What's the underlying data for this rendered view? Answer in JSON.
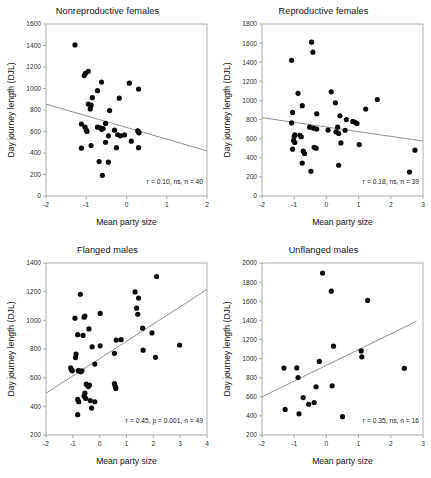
{
  "figure": {
    "panel_count": 4
  },
  "panels": [
    {
      "id": "nonreproductive-females",
      "title": "Nonreproductive females",
      "annotation": "r = 0.10, ns, n = 40"
    },
    {
      "id": "reproductive-females",
      "title": "Reproductive females",
      "annotation": "r = 0.18, ns, n = 39"
    },
    {
      "id": "flanged-males",
      "title": "Flanged males",
      "annotation": "r = 0.45, p = 0.001, n = 49"
    },
    {
      "id": "unflanged-males",
      "title": "Unflanged males",
      "annotation": "r = 0.35, ns, n = 16"
    }
  ],
  "chart_data": [
    {
      "type": "scatter",
      "title": "Nonreproductive females",
      "xlabel": "Mean party size",
      "ylabel": "Day journey length (DJL)",
      "xlim": [
        -2,
        2
      ],
      "ylim": [
        0,
        1600
      ],
      "xticks": [
        -2,
        -1,
        0,
        1,
        2
      ],
      "yticks": [
        0,
        200,
        400,
        600,
        800,
        1000,
        1200,
        1400,
        1600
      ],
      "xtick_labels": [
        "-2",
        "-1",
        "0",
        "1",
        "2"
      ],
      "ytick_labels": [
        "0",
        "200",
        "400",
        "600",
        "800",
        "1000",
        "1200",
        "1400",
        "1600"
      ],
      "grid": false,
      "legend": "none",
      "annotation": "r = 0.10, ns, n = 40",
      "annotation_stats": {
        "r": 0.1,
        "p_text": "ns",
        "n": 40
      },
      "trendline": {
        "x0": -2,
        "y0": 855,
        "x1": 2,
        "y1": 420
      },
      "points": [
        [
          -1.28,
          1405
        ],
        [
          -1.05,
          1120
        ],
        [
          -1.02,
          1140
        ],
        [
          -0.95,
          1160
        ],
        [
          -0.62,
          1060
        ],
        [
          0.07,
          1050
        ],
        [
          0.3,
          995
        ],
        [
          -0.72,
          980
        ],
        [
          -0.85,
          915
        ],
        [
          -0.18,
          910
        ],
        [
          -0.95,
          855
        ],
        [
          -0.88,
          845
        ],
        [
          -0.9,
          810
        ],
        [
          -0.42,
          795
        ],
        [
          -0.52,
          675
        ],
        [
          -1.12,
          670
        ],
        [
          -0.72,
          640
        ],
        [
          -0.65,
          635
        ],
        [
          -0.62,
          620
        ],
        [
          -0.58,
          628
        ],
        [
          -1.03,
          640
        ],
        [
          -1.0,
          612
        ],
        [
          -0.98,
          600
        ],
        [
          -0.3,
          612
        ],
        [
          -0.22,
          570
        ],
        [
          -0.05,
          568
        ],
        [
          0.28,
          605
        ],
        [
          0.31,
          588
        ],
        [
          0.3,
          598
        ],
        [
          -0.45,
          560
        ],
        [
          -0.15,
          560
        ],
        [
          -0.52,
          500
        ],
        [
          -0.88,
          470
        ],
        [
          -1.12,
          445
        ],
        [
          -0.25,
          450
        ],
        [
          0.12,
          510
        ],
        [
          0.3,
          450
        ],
        [
          -0.68,
          320
        ],
        [
          -0.45,
          315
        ],
        [
          -0.6,
          192
        ]
      ]
    },
    {
      "type": "scatter",
      "title": "Reproductive females",
      "xlabel": "Mean party size",
      "ylabel": "Day journey length (DJL)",
      "xlim": [
        -2,
        3
      ],
      "ylim": [
        0,
        1800
      ],
      "xticks": [
        -2,
        -1,
        0,
        1,
        2,
        3
      ],
      "yticks": [
        0,
        200,
        400,
        600,
        800,
        1000,
        1200,
        1400,
        1600,
        1800
      ],
      "xtick_labels": [
        "-2",
        "-1",
        "0",
        "1",
        "2",
        "3"
      ],
      "ytick_labels": [
        "0",
        "200",
        "400",
        "600",
        "800",
        "1000",
        "1200",
        "1400",
        "1600",
        "1800"
      ],
      "grid": false,
      "legend": "none",
      "annotation": "r = 0.18, ns, n = 39",
      "annotation_stats": {
        "r": 0.18,
        "p_text": "ns",
        "n": 39
      },
      "trendline": {
        "x0": -2,
        "y0": 820,
        "x1": 3,
        "y1": 575
      },
      "points": [
        [
          -0.46,
          1610
        ],
        [
          -0.42,
          1505
        ],
        [
          -1.08,
          1420
        ],
        [
          0.15,
          1090
        ],
        [
          -0.88,
          1075
        ],
        [
          1.58,
          1010
        ],
        [
          0.28,
          975
        ],
        [
          -0.75,
          945
        ],
        [
          1.22,
          910
        ],
        [
          -1.05,
          875
        ],
        [
          -0.3,
          860
        ],
        [
          0.42,
          840
        ],
        [
          0.62,
          800
        ],
        [
          0.82,
          780
        ],
        [
          0.9,
          770
        ],
        [
          0.95,
          758
        ],
        [
          -1.08,
          765
        ],
        [
          -0.52,
          720
        ],
        [
          -0.4,
          710
        ],
        [
          -0.3,
          700
        ],
        [
          0.05,
          690
        ],
        [
          0.35,
          720
        ],
        [
          0.58,
          688
        ],
        [
          -0.98,
          640
        ],
        [
          -1.0,
          622
        ],
        [
          -0.82,
          635
        ],
        [
          -0.78,
          620
        ],
        [
          0.3,
          672
        ],
        [
          0.38,
          655
        ],
        [
          -1.02,
          580
        ],
        [
          -0.98,
          560
        ],
        [
          0.45,
          555
        ],
        [
          1.02,
          538
        ],
        [
          -1.05,
          490
        ],
        [
          -0.72,
          470
        ],
        [
          -0.68,
          445
        ],
        [
          -0.38,
          510
        ],
        [
          -0.32,
          500
        ],
        [
          2.75,
          480
        ],
        [
          -0.75,
          345
        ],
        [
          0.38,
          322
        ],
        [
          -0.48,
          258
        ],
        [
          2.58,
          250
        ]
      ]
    },
    {
      "type": "scatter",
      "title": "Flanged males",
      "xlabel": "Mean party size",
      "ylabel": "Day journey length (DJL)",
      "xlim": [
        -2,
        4
      ],
      "ylim": [
        200,
        1400
      ],
      "xticks": [
        -2,
        -1,
        0,
        1,
        2,
        3,
        4
      ],
      "yticks": [
        200,
        400,
        600,
        800,
        1000,
        1200,
        1400
      ],
      "xtick_labels": [
        "-2",
        "-1",
        "0",
        "1",
        "2",
        "3",
        "4"
      ],
      "ytick_labels": [
        "200",
        "400",
        "600",
        "800",
        "1000",
        "1200",
        "1400"
      ],
      "grid": false,
      "legend": "none",
      "annotation": "r = 0.45, p = 0.001, n = 49",
      "annotation_stats": {
        "r": 0.45,
        "p_text": "p = 0.001",
        "n": 49
      },
      "trendline": {
        "x0": -2,
        "y0": 492,
        "x1": 4,
        "y1": 1215
      },
      "points": [
        [
          2.12,
          1305
        ],
        [
          -0.72,
          1182
        ],
        [
          1.32,
          1198
        ],
        [
          1.45,
          1155
        ],
        [
          1.38,
          1085
        ],
        [
          1.42,
          1042
        ],
        [
          -0.55,
          1030
        ],
        [
          -0.92,
          1015
        ],
        [
          0.02,
          1048
        ],
        [
          -0.58,
          1022
        ],
        [
          -0.4,
          940
        ],
        [
          1.6,
          945
        ],
        [
          1.95,
          912
        ],
        [
          -0.82,
          900
        ],
        [
          -0.62,
          895
        ],
        [
          2.98,
          828
        ],
        [
          0.62,
          862
        ],
        [
          0.8,
          865
        ],
        [
          -0.28,
          815
        ],
        [
          0.02,
          822
        ],
        [
          1.62,
          792
        ],
        [
          0.55,
          770
        ],
        [
          2.08,
          742
        ],
        [
          -0.88,
          765
        ],
        [
          -0.9,
          740
        ],
        [
          -0.18,
          695
        ],
        [
          -1.08,
          668
        ],
        [
          -1.05,
          655
        ],
        [
          -1.02,
          648
        ],
        [
          -0.8,
          650
        ],
        [
          -0.75,
          645
        ],
        [
          -0.7,
          642
        ],
        [
          -0.66,
          648
        ],
        [
          -0.5,
          555
        ],
        [
          -0.45,
          545
        ],
        [
          -0.42,
          538
        ],
        [
          -0.38,
          548
        ],
        [
          0.55,
          558
        ],
        [
          0.58,
          540
        ],
        [
          0.6,
          525
        ],
        [
          -0.55,
          492
        ],
        [
          -0.58,
          472
        ],
        [
          -0.52,
          455
        ],
        [
          -0.82,
          448
        ],
        [
          -0.78,
          432
        ],
        [
          -0.35,
          440
        ],
        [
          -0.18,
          432
        ],
        [
          -0.3,
          388
        ],
        [
          -0.82,
          342
        ]
      ]
    },
    {
      "type": "scatter",
      "title": "Unflanged males",
      "xlabel": "Mean party size",
      "ylabel": "Day journey length (DJL)",
      "xlim": [
        -2,
        3
      ],
      "ylim": [
        200,
        2000
      ],
      "xticks": [
        -2,
        -1,
        0,
        1,
        2,
        3
      ],
      "yticks": [
        200,
        400,
        600,
        800,
        1000,
        1200,
        1400,
        1600,
        1800,
        2000
      ],
      "xtick_labels": [
        "-2",
        "-1",
        "0",
        "1",
        "2",
        "3"
      ],
      "ytick_labels": [
        "200",
        "400",
        "600",
        "800",
        "1000",
        "1200",
        "1400",
        "1600",
        "1800",
        "2000"
      ],
      "grid": false,
      "legend": "none",
      "annotation": "r = 0.35, ns, n = 16",
      "annotation_stats": {
        "r": 0.35,
        "p_text": "ns",
        "n": 16
      },
      "trendline": {
        "x0": -2,
        "y0": 600,
        "x1": 2.8,
        "y1": 1390
      },
      "points": [
        [
          -0.12,
          1895
        ],
        [
          0.15,
          1705
        ],
        [
          1.28,
          1608
        ],
        [
          0.22,
          1130
        ],
        [
          1.08,
          1080
        ],
        [
          1.1,
          1018
        ],
        [
          -0.22,
          970
        ],
        [
          -1.32,
          900
        ],
        [
          -0.92,
          902
        ],
        [
          2.42,
          898
        ],
        [
          -0.88,
          802
        ],
        [
          -0.32,
          705
        ],
        [
          0.18,
          715
        ],
        [
          -0.72,
          592
        ],
        [
          -0.55,
          522
        ],
        [
          -0.38,
          540
        ],
        [
          -1.28,
          468
        ],
        [
          -0.85,
          422
        ],
        [
          0.5,
          392
        ]
      ]
    }
  ]
}
